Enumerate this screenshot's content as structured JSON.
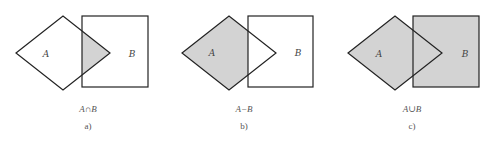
{
  "colors": {
    "stroke": "#222222",
    "fill": "#d3d3d3",
    "background": "#ffffff"
  },
  "panels": [
    {
      "id": "a",
      "operation": "intersection",
      "expression": "A∩B",
      "sublabel": "a)",
      "set_a_label": "A",
      "set_b_label": "B",
      "shaded_region": "A intersect B"
    },
    {
      "id": "b",
      "operation": "difference",
      "expression": "A−B",
      "sublabel": "b)",
      "set_a_label": "A",
      "set_b_label": "B",
      "shaded_region": "A minus B"
    },
    {
      "id": "c",
      "operation": "union",
      "expression": "A∪B",
      "sublabel": "c)",
      "set_a_label": "A",
      "set_b_label": "B",
      "shaded_region": "A union B"
    }
  ]
}
